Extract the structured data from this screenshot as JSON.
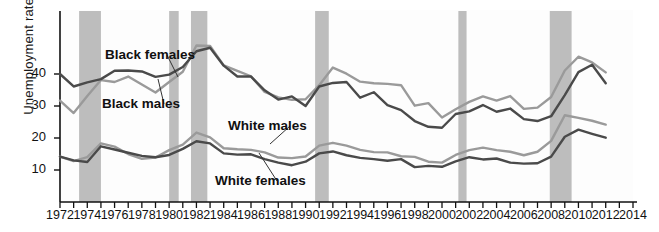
{
  "chart_data": {
    "type": "line",
    "title": "",
    "xlabel": "",
    "ylabel": "Unemployment rate (percent)",
    "xlim": [
      1972,
      2014
    ],
    "ylim": [
      0,
      50
    ],
    "yticks": [
      10,
      20,
      30,
      40
    ],
    "xticks": [
      1972,
      1973,
      1974,
      1975,
      1976,
      1977,
      1978,
      1979,
      1980,
      1981,
      1982,
      1983,
      1984,
      1985,
      1986,
      1987,
      1988,
      1989,
      1990,
      1991,
      1992,
      1993,
      1994,
      1995,
      1996,
      1997,
      1998,
      1999,
      2000,
      2001,
      2002,
      2003,
      2004,
      2005,
      2006,
      2007,
      2008,
      2009,
      2010,
      2011,
      2012,
      2013,
      2014
    ],
    "xtick_labels_shown": [
      1972,
      1974,
      1976,
      1978,
      1980,
      1982,
      1984,
      1986,
      1988,
      1990,
      1992,
      1994,
      1996,
      1998,
      2000,
      2002,
      2004,
      2006,
      2008,
      2010,
      2012,
      2014
    ],
    "grid": false,
    "legend_position": "inline-annotations",
    "x": [
      1972,
      1973,
      1974,
      1975,
      1976,
      1977,
      1978,
      1979,
      1980,
      1981,
      1982,
      1983,
      1984,
      1985,
      1986,
      1987,
      1988,
      1989,
      1990,
      1991,
      1992,
      1993,
      1994,
      1995,
      1996,
      1997,
      1998,
      1999,
      2000,
      2001,
      2002,
      2003,
      2004,
      2005,
      2006,
      2007,
      2008,
      2009,
      2010,
      2011,
      2012
    ],
    "series": [
      {
        "name": "Black females",
        "color": "#4a4a4a",
        "values": [
          40.0,
          36.1,
          37.4,
          38.4,
          41.0,
          41.1,
          40.8,
          39.1,
          39.8,
          42.2,
          47.1,
          48.2,
          42.6,
          39.2,
          39.2,
          34.9,
          32.0,
          33.0,
          30.0,
          36.1,
          37.2,
          37.5,
          32.6,
          34.3,
          30.3,
          28.7,
          25.3,
          23.5,
          23.2,
          27.5,
          28.3,
          30.3,
          28.2,
          29.2,
          25.9,
          25.3,
          26.8,
          33.4,
          40.6,
          42.9,
          37.1
        ]
      },
      {
        "name": "Black males",
        "color": "#9a9a9a",
        "values": [
          31.7,
          27.8,
          33.1,
          38.1,
          37.5,
          39.2,
          36.7,
          34.2,
          37.5,
          40.7,
          48.9,
          48.8,
          42.7,
          41.0,
          39.3,
          34.4,
          32.7,
          31.9,
          32.1,
          36.5,
          42.0,
          40.1,
          37.6,
          37.1,
          36.9,
          36.5,
          30.1,
          30.9,
          26.4,
          29.0,
          31.3,
          33.0,
          31.7,
          33.1,
          29.1,
          29.5,
          32.8,
          41.1,
          45.4,
          43.6,
          40.5
        ]
      },
      {
        "name": "White males",
        "color": "#9a9a9a",
        "values": [
          14.2,
          12.8,
          14.0,
          18.3,
          17.3,
          15.0,
          13.5,
          13.9,
          16.2,
          17.9,
          21.7,
          20.2,
          16.8,
          16.5,
          16.3,
          15.5,
          13.9,
          13.7,
          14.2,
          17.6,
          18.5,
          17.6,
          16.3,
          15.6,
          15.5,
          14.3,
          14.1,
          12.6,
          12.3,
          14.7,
          16.2,
          17.0,
          16.2,
          15.7,
          14.6,
          15.7,
          19.1,
          27.1,
          26.3,
          25.4,
          24.2
        ]
      },
      {
        "name": "White females",
        "color": "#4a4a4a",
        "values": [
          14.2,
          13.0,
          12.5,
          17.4,
          16.4,
          15.4,
          14.4,
          14.0,
          14.7,
          16.6,
          19.0,
          18.3,
          15.2,
          14.8,
          14.9,
          13.4,
          12.3,
          11.5,
          12.6,
          15.2,
          15.8,
          14.6,
          13.8,
          13.4,
          12.9,
          13.4,
          10.9,
          11.3,
          11.0,
          12.7,
          14.0,
          13.3,
          13.6,
          12.3,
          12.0,
          12.1,
          14.2,
          20.4,
          22.6,
          21.3,
          20.1
        ]
      }
    ],
    "recession_bands": [
      {
        "start": 1973.4,
        "end": 1975.0
      },
      {
        "start": 1980.0,
        "end": 1980.7
      },
      {
        "start": 1981.6,
        "end": 1982.8
      },
      {
        "start": 1990.7,
        "end": 1991.7
      },
      {
        "start": 2001.2,
        "end": 2001.8
      },
      {
        "start": 2007.9,
        "end": 2009.5
      }
    ],
    "annotations": [
      {
        "text": "Black females",
        "x": 105,
        "y": 47,
        "leader_to_x": 178,
        "leader_to_y": 77
      },
      {
        "text": "Black males",
        "x": 102,
        "y": 96,
        "leader_to_x": 158,
        "leader_to_y": 79
      },
      {
        "text": "White males",
        "x": 228,
        "y": 118,
        "leader_to_x": 270,
        "leader_to_y": 144
      },
      {
        "text": "White females",
        "x": 215,
        "y": 173,
        "leader_to_x": 259,
        "leader_to_y": 153
      }
    ],
    "colors": {
      "dark_series": "#4a4a4a",
      "light_series": "#9a9a9a",
      "recession_band": "#bdbdbd",
      "axis": "#111111",
      "text": "#111111",
      "background": "#ffffff"
    }
  }
}
